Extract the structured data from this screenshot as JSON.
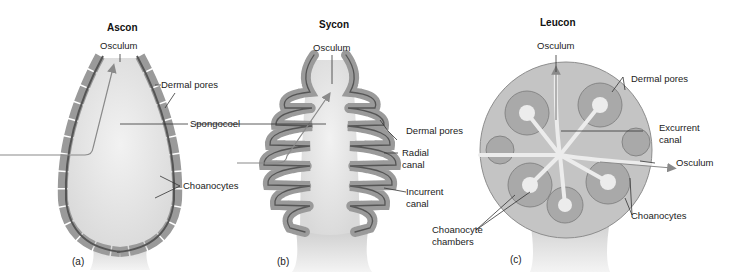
{
  "figure": {
    "panels": [
      {
        "id": "a",
        "title": "Ascon",
        "tag": "(a)",
        "labels": {
          "osculum": "Osculum",
          "dermal_pores": "Dermal pores",
          "spongocoel": "Spongocoel",
          "choanocytes": "Choanocytes"
        }
      },
      {
        "id": "b",
        "title": "Sycon",
        "tag": "(b)",
        "labels": {
          "osculum": "Osculum",
          "dermal_pores": "Dermal pores",
          "radial_canal_1": "Radial",
          "radial_canal_2": "canal",
          "incurrent_canal_1": "Incurrent",
          "incurrent_canal_2": "canal"
        }
      },
      {
        "id": "c",
        "title": "Leucon",
        "tag": "(c)",
        "labels": {
          "osculum_top": "Osculum",
          "dermal_pores": "Dermal pores",
          "excurrent_canal_1": "Excurrent",
          "excurrent_canal_2": "canal",
          "osculum_side": "Osculum",
          "choanocytes": "Choanocytes",
          "choanocyte_chambers_1": "Choanocyte",
          "choanocyte_chambers_2": "chambers"
        }
      }
    ],
    "colors": {
      "cell_fill": "#9a9a9a",
      "cell_stroke": "#6e6e6e",
      "choanocyte_dark": "#555555",
      "cavity": "#e4e4e4",
      "arrow": "#8a8a8a",
      "leader": "#333333"
    }
  }
}
